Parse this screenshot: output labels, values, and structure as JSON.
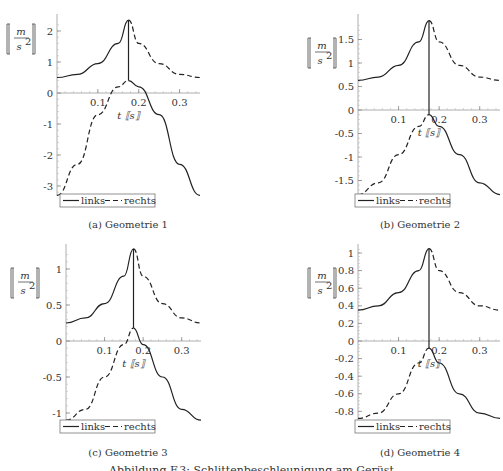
{
  "figure_caption": "Abbildung F.3: Schlittenbeschleunigung am Gerüst",
  "legend": {
    "solid": "links",
    "dashed": "rechts"
  },
  "ylabel_num": "m",
  "ylabel_den": "s",
  "ylabel_exp": "2",
  "xlabel": "t [[s]]",
  "chart_data": [
    {
      "type": "line",
      "panel": "a",
      "title": "(a) Geometrie 1",
      "xlabel": "t [s]",
      "ylabel": "[m/s²]",
      "xlim": [
        0,
        0.35
      ],
      "ylim": [
        -3.3,
        2.35
      ],
      "xticks": [
        0.1,
        0.2,
        0.3
      ],
      "yticks": [
        -3,
        -2,
        -1,
        0,
        1,
        2
      ],
      "series": [
        {
          "name": "links",
          "style": "solid",
          "x": [
            0,
            0.05,
            0.1,
            0.15,
            0.175,
            0.175,
            0.2,
            0.25,
            0.3,
            0.35
          ],
          "y": [
            0.5,
            0.6,
            0.95,
            1.6,
            2.35,
            0.4,
            0.2,
            -0.7,
            -2.3,
            -3.3
          ]
        },
        {
          "name": "rechts",
          "style": "dashed",
          "x": [
            0,
            0.05,
            0.1,
            0.15,
            0.175,
            0.175,
            0.2,
            0.25,
            0.3,
            0.35
          ],
          "y": [
            -3.3,
            -2.3,
            -0.7,
            0.2,
            0.4,
            2.35,
            1.6,
            0.95,
            0.6,
            0.5
          ]
        }
      ]
    },
    {
      "type": "line",
      "panel": "b",
      "title": "(b) Geometrie 2",
      "xlabel": "t [s]",
      "ylabel": "[m/s²]",
      "xlim": [
        0,
        0.35
      ],
      "ylim": [
        -1.8,
        1.9
      ],
      "xticks": [
        0.1,
        0.2,
        0.3
      ],
      "yticks": [
        -1.5,
        -1,
        -0.5,
        0,
        0.5,
        1,
        1.5
      ],
      "series": [
        {
          "name": "links",
          "style": "solid",
          "x": [
            0,
            0.05,
            0.1,
            0.15,
            0.175,
            0.175,
            0.2,
            0.25,
            0.3,
            0.35
          ],
          "y": [
            0.63,
            0.7,
            0.95,
            1.45,
            1.9,
            -0.1,
            -0.35,
            -0.95,
            -1.55,
            -1.8
          ]
        },
        {
          "name": "rechts",
          "style": "dashed",
          "x": [
            0,
            0.05,
            0.1,
            0.15,
            0.175,
            0.175,
            0.2,
            0.25,
            0.3,
            0.35
          ],
          "y": [
            -1.8,
            -1.55,
            -0.95,
            -0.35,
            -0.1,
            1.9,
            1.45,
            0.95,
            0.7,
            0.63
          ]
        }
      ]
    },
    {
      "type": "line",
      "panel": "c",
      "title": "(c) Geometrie 3",
      "xlabel": "t [s]",
      "ylabel": "[m/s²]",
      "xlim": [
        0,
        0.35
      ],
      "ylim": [
        -1.1,
        1.28
      ],
      "xticks": [
        0.1,
        0.2,
        0.3
      ],
      "yticks": [
        -1,
        -0.5,
        0,
        0.5,
        1
      ],
      "series": [
        {
          "name": "links",
          "style": "solid",
          "x": [
            0,
            0.05,
            0.1,
            0.15,
            0.175,
            0.175,
            0.2,
            0.25,
            0.3,
            0.35
          ],
          "y": [
            0.25,
            0.32,
            0.52,
            0.9,
            1.28,
            0.18,
            -0.05,
            -0.5,
            -0.95,
            -1.1
          ]
        },
        {
          "name": "rechts",
          "style": "dashed",
          "x": [
            0,
            0.05,
            0.1,
            0.15,
            0.175,
            0.175,
            0.2,
            0.25,
            0.3,
            0.35
          ],
          "y": [
            -1.1,
            -0.95,
            -0.5,
            -0.05,
            0.18,
            1.28,
            0.9,
            0.52,
            0.32,
            0.25
          ]
        }
      ]
    },
    {
      "type": "line",
      "panel": "d",
      "title": "(d) Geometrie 4",
      "xlabel": "t [s]",
      "ylabel": "[m/s²]",
      "xlim": [
        0,
        0.35
      ],
      "ylim": [
        -0.88,
        1.05
      ],
      "xticks": [
        0.1,
        0.2,
        0.3
      ],
      "yticks": [
        -0.8,
        -0.6,
        -0.4,
        -0.2,
        0,
        0.2,
        0.4,
        0.6,
        0.8,
        1
      ],
      "series": [
        {
          "name": "links",
          "style": "solid",
          "x": [
            0,
            0.05,
            0.1,
            0.15,
            0.175,
            0.175,
            0.2,
            0.25,
            0.3,
            0.35
          ],
          "y": [
            0.35,
            0.4,
            0.55,
            0.8,
            1.05,
            -0.08,
            -0.25,
            -0.6,
            -0.82,
            -0.88
          ]
        },
        {
          "name": "rechts",
          "style": "dashed",
          "x": [
            0,
            0.05,
            0.1,
            0.15,
            0.175,
            0.175,
            0.2,
            0.25,
            0.3,
            0.35
          ],
          "y": [
            -0.88,
            -0.82,
            -0.6,
            -0.25,
            -0.08,
            1.05,
            0.8,
            0.55,
            0.4,
            0.35
          ]
        }
      ]
    }
  ]
}
